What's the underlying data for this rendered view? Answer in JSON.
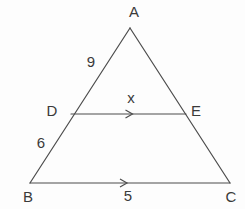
{
  "diagram": {
    "background": "#fdfdfd",
    "stroke_color": "#4d4d4d",
    "text_color": "#3a3a3a",
    "stroke_width": 1.2,
    "font_size": 15,
    "points": {
      "A": {
        "x": 130,
        "y": 28
      },
      "B": {
        "x": 30,
        "y": 183
      },
      "C": {
        "x": 230,
        "y": 183
      },
      "D": {
        "x": 71,
        "y": 114
      },
      "E": {
        "x": 186,
        "y": 114
      }
    },
    "segments": [
      {
        "from": "A",
        "to": "B",
        "parallel_mark": false,
        "mark_dx": 0
      },
      {
        "from": "A",
        "to": "C",
        "parallel_mark": false,
        "mark_dx": 0
      },
      {
        "from": "B",
        "to": "C",
        "parallel_mark": true,
        "mark_dx": -4
      },
      {
        "from": "D",
        "to": "E",
        "parallel_mark": true,
        "mark_dx": 3
      }
    ],
    "vertex_labels": [
      {
        "name": "vertex-label-A",
        "text": "A",
        "x": 134,
        "y": 11
      },
      {
        "name": "vertex-label-B",
        "text": "B",
        "x": 28,
        "y": 196
      },
      {
        "name": "vertex-label-C",
        "text": "C",
        "x": 231,
        "y": 196
      },
      {
        "name": "vertex-label-D",
        "text": "D",
        "x": 52,
        "y": 110
      },
      {
        "name": "vertex-label-E",
        "text": "E",
        "x": 196,
        "y": 110
      }
    ],
    "measure_labels": [
      {
        "name": "length-AD-label",
        "text": "9",
        "x": 91,
        "y": 61
      },
      {
        "name": "length-DB-label",
        "text": "6",
        "x": 41,
        "y": 142
      },
      {
        "name": "length-DE-label",
        "text": "x",
        "x": 131,
        "y": 97
      },
      {
        "name": "length-BC-label",
        "text": "5",
        "x": 128,
        "y": 195
      }
    ]
  }
}
